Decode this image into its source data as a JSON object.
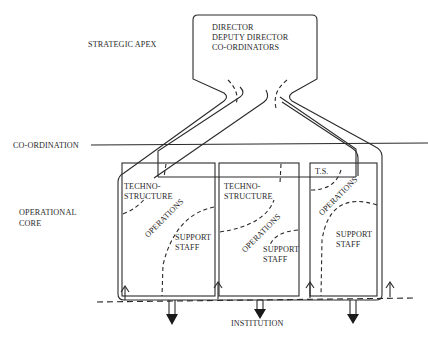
{
  "diagram": {
    "type": "organizational-structure",
    "left_labels": {
      "strategic_apex": "STRATEGIC APEX",
      "coordination": "CO-ORDINATION",
      "operational_core_line1": "OPERATIONAL",
      "operational_core_line2": "CORE"
    },
    "apex": {
      "lines": [
        "DIRECTOR",
        "DEPUTY DIRECTOR",
        "CO-ORDINATORS"
      ]
    },
    "units": [
      {
        "technostructure_line1": "TECHNO-",
        "technostructure_line2": "STRUCTURE",
        "operations": "OPERATIONS",
        "support_line1": "SUPPORT",
        "support_line2": "STAFF"
      },
      {
        "technostructure_line1": "TECHNO-",
        "technostructure_line2": "STRUCTURE",
        "operations": "OPERATIONS",
        "support_line1": "SUPPORT",
        "support_line2": "STAFF"
      },
      {
        "technostructure_line1": "T.S.",
        "operations": "OPERATIONS",
        "support_line1": "SUPPORT",
        "support_line2": "STAFF"
      }
    ],
    "bottom_label": "INSTITUTION",
    "upward_arrow_count": 4,
    "downward_arrow_count": 3
  }
}
